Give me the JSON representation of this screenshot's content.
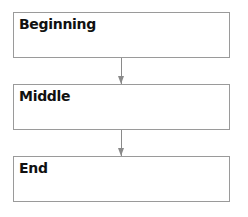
{
  "diagram": {
    "type": "flowchart",
    "direction": "top-to-bottom",
    "nodes": [
      {
        "id": "beginning",
        "label": "Beginning"
      },
      {
        "id": "middle",
        "label": "Middle"
      },
      {
        "id": "end",
        "label": "End"
      }
    ],
    "edges": [
      {
        "from": "beginning",
        "to": "middle"
      },
      {
        "from": "middle",
        "to": "end"
      }
    ],
    "colors": {
      "border": "#9a9a9a",
      "arrow": "#8a8a8a",
      "text": "#111111",
      "background": "#ffffff"
    }
  }
}
